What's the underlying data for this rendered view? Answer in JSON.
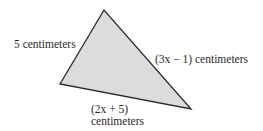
{
  "figure": {
    "shape": "triangle",
    "fill_color": "#dcdcdc",
    "stroke_color": "#2a2a2a",
    "vertices": {
      "top": [
        104,
        10
      ],
      "left": [
        60,
        84
      ],
      "right": [
        191,
        109
      ]
    },
    "labels": {
      "left_side": "5 centimeters",
      "right_side": "(3x − 1) centimeters",
      "bottom_side_line1": "(2x + 5)",
      "bottom_side_line2": "centimeters"
    }
  }
}
